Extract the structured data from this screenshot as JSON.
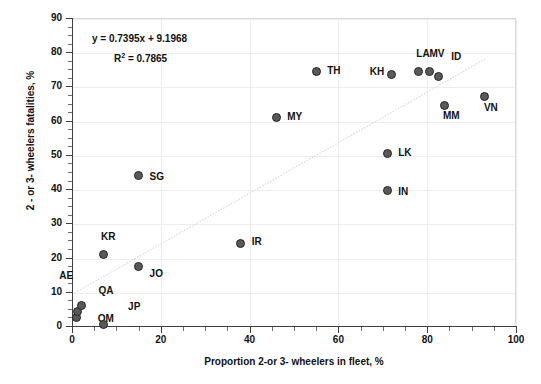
{
  "chart_data": {
    "type": "scatter",
    "title": "",
    "xlabel": "Proportion 2-or 3- wheelers in fleet, %",
    "ylabel": "2 - or 3- wheelers fatalities, %",
    "xlim": [
      0,
      100
    ],
    "ylim": [
      0,
      90
    ],
    "xticks": [
      0,
      20,
      40,
      60,
      80,
      100
    ],
    "yticks": [
      0,
      10,
      20,
      30,
      40,
      50,
      60,
      70,
      80,
      90
    ],
    "x_minor_tick_step": 5,
    "y_minor_tick_step": 2.5,
    "grid": true,
    "legend": "none",
    "marker_color": "#595959",
    "marker_edge_color": "#262626",
    "trendline": {
      "type": "linear",
      "equation": "y = 0.7395x + 9.1968",
      "r2_label": "R² = 0.7865",
      "slope": 0.7395,
      "intercept": 9.1968,
      "r_squared": 0.7865,
      "color": "#d9d9d9",
      "style": "dotted",
      "x_start": 0,
      "x_end": 93
    },
    "points": [
      {
        "label": "QA",
        "x": 1.0,
        "y": 2.5,
        "label_dx": 22,
        "label_dy": -26
      },
      {
        "label": "AE",
        "x": 1.2,
        "y": 4.2,
        "label_dx": -18,
        "label_dy": -36
      },
      {
        "label": "OM",
        "x": 2.2,
        "y": 6.0,
        "label_dx": 16,
        "label_dy": 14
      },
      {
        "label": "JP",
        "x": 7.0,
        "y": 0.3,
        "label_dx": 25,
        "label_dy": -18
      },
      {
        "label": "KR",
        "x": 7.0,
        "y": 21.0,
        "label_dx": -2,
        "label_dy": -17
      },
      {
        "label": "JO",
        "x": 15.0,
        "y": 17.5,
        "label_dx": 11,
        "label_dy": 8
      },
      {
        "label": "SG",
        "x": 15.0,
        "y": 44.0,
        "label_dx": 11,
        "label_dy": 2
      },
      {
        "label": "IR",
        "x": 38.0,
        "y": 24.0,
        "label_dx": 11,
        "label_dy": -2
      },
      {
        "label": "MY",
        "x": 46.0,
        "y": 61.0,
        "label_dx": 11,
        "label_dy": 0
      },
      {
        "label": "TH",
        "x": 55.0,
        "y": 74.5,
        "label_dx": 11,
        "label_dy": 0
      },
      {
        "label": "IN",
        "x": 71.0,
        "y": 39.5,
        "label_dx": 11,
        "label_dy": 1
      },
      {
        "label": "LK",
        "x": 71.0,
        "y": 50.5,
        "label_dx": 11,
        "label_dy": 0
      },
      {
        "label": "KH",
        "x": 72.0,
        "y": 73.5,
        "label_dx": -22,
        "label_dy": -2
      },
      {
        "label": "LA",
        "x": 78.0,
        "y": 74.5,
        "label_dx": -2,
        "label_dy": -17
      },
      {
        "label": "MV",
        "x": 80.5,
        "y": 74.5,
        "label_dx": 0,
        "label_dy": -17
      },
      {
        "label": "ID",
        "x": 82.5,
        "y": 73.0,
        "label_dx": 13,
        "label_dy": -19
      },
      {
        "label": "MM",
        "x": 84.0,
        "y": 64.5,
        "label_dx": -2,
        "label_dy": 11
      },
      {
        "label": "VN",
        "x": 93.0,
        "y": 67.0,
        "label_dx": -1,
        "label_dy": 11
      }
    ]
  }
}
